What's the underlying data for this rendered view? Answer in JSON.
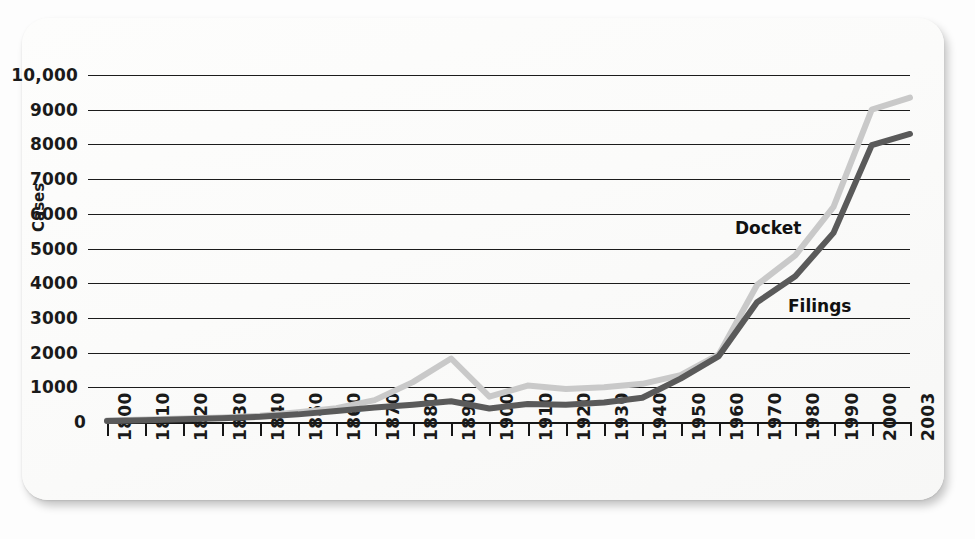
{
  "chart_data": {
    "type": "line",
    "title": "",
    "xlabel": "",
    "ylabel": "Cases",
    "ylim": [
      0,
      10000
    ],
    "xlim": [
      1800,
      2003
    ],
    "grid": true,
    "legend": "inline-labels",
    "y_ticks": [
      "0",
      "1000",
      "2000",
      "3000",
      "4000",
      "5000",
      "6000",
      "7000",
      "8000",
      "9000",
      "10,000"
    ],
    "y_tick_values": [
      0,
      1000,
      2000,
      3000,
      4000,
      5000,
      6000,
      7000,
      8000,
      9000,
      10000
    ],
    "x_ticks": [
      "1800",
      "1810",
      "1820",
      "1830",
      "1840",
      "1850",
      "1860",
      "1870",
      "1880",
      "1890",
      "1900",
      "1910",
      "1920",
      "1930",
      "1940",
      "1950",
      "1960",
      "1970",
      "1980",
      "1990",
      "2000",
      "2003"
    ],
    "x": [
      1800,
      1810,
      1820,
      1830,
      1840,
      1850,
      1860,
      1870,
      1880,
      1890,
      1900,
      1910,
      1920,
      1930,
      1940,
      1950,
      1960,
      1970,
      1980,
      1990,
      2000,
      2003
    ],
    "series": [
      {
        "name": "Docket",
        "color": "#c9c9c9",
        "values": [
          40,
          70,
          100,
          130,
          180,
          280,
          400,
          630,
          1150,
          1830,
          730,
          1050,
          950,
          1000,
          1100,
          1350,
          1950,
          3950,
          4800,
          6200,
          9000,
          9350
        ]
      },
      {
        "name": "Filings",
        "color": "#5a5a5a",
        "values": [
          30,
          50,
          80,
          110,
          150,
          220,
          320,
          420,
          500,
          600,
          390,
          520,
          500,
          560,
          700,
          1250,
          1900,
          3450,
          4200,
          5450,
          7980,
          8300
        ]
      }
    ]
  },
  "labels": {
    "docket": "Docket",
    "filings": "Filings",
    "cases": "Cases"
  },
  "colors": {
    "docket_line": "#c9c9c9",
    "filings_line": "#5a5a5a",
    "grid": "#1c1c1c",
    "axis": "#161616",
    "card_background": "#fbfbfa",
    "page_background": "#fdfdfd"
  }
}
